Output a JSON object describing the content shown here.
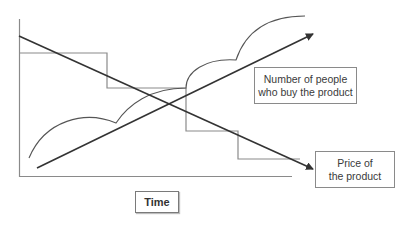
{
  "diagram": {
    "title": "",
    "labels": {
      "buyers": [
        "Number of people",
        "who buy the product"
      ],
      "price": [
        "Price of",
        "the product"
      ],
      "time": "Time"
    },
    "elements": {
      "axes": "L-shaped axes (vertical y-axis, horizontal time axis)",
      "price_trend": "Straight arrow descending from top-left to bottom-right (price decreases over time)",
      "price_steps": "Step function descending in four steps alongside the price trend",
      "buyers_trend": "Straight arrow ascending from bottom-left to top-right (buyers increase over time)",
      "buyers_curve": "Scalloped curve of successive adoption waves rising over time"
    },
    "colors": {
      "line": "#3a3a3a",
      "step_line": "#8a8a8a",
      "box_border": "#8a8a8a",
      "text": "#3a3a3a",
      "background": "#ffffff"
    }
  }
}
